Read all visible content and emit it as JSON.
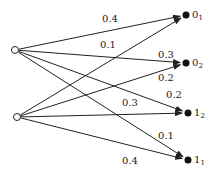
{
  "diagram": {
    "type": "bipartite-transition-graph",
    "sources": [
      {
        "id": "s0",
        "x": 15,
        "y": 50
      },
      {
        "id": "s1",
        "x": 17,
        "y": 117
      }
    ],
    "targets": [
      {
        "id": "t0",
        "label": "0",
        "sub": "1",
        "x": 186,
        "y": 15
      },
      {
        "id": "t1",
        "label": "0",
        "sub": "2",
        "x": 186,
        "y": 63
      },
      {
        "id": "t2",
        "label": "1",
        "sub": "2",
        "x": 188,
        "y": 113
      },
      {
        "id": "t3",
        "label": "1",
        "sub": "1",
        "x": 188,
        "y": 160
      }
    ],
    "edges": [
      {
        "from": "s0",
        "to": "t0",
        "weight": "0.4",
        "lx": 110,
        "ly": 22
      },
      {
        "from": "s0",
        "to": "t1",
        "weight": "0.3",
        "lx": 166,
        "ly": 58
      },
      {
        "from": "s0",
        "to": "t2",
        "weight": "0.2",
        "lx": 174,
        "ly": 98
      },
      {
        "from": "s0",
        "to": "t3",
        "weight": "0.1",
        "lx": 166,
        "ly": 139
      },
      {
        "from": "s1",
        "to": "t0",
        "weight": "0.1",
        "lx": 108,
        "ly": 48
      },
      {
        "from": "s1",
        "to": "t1",
        "weight": "0.2",
        "lx": 166,
        "ly": 81
      },
      {
        "from": "s1",
        "to": "t2",
        "weight": "0.3",
        "lx": 130,
        "ly": 106
      },
      {
        "from": "s1",
        "to": "t3",
        "weight": "0.4",
        "lx": 130,
        "ly": 164
      }
    ]
  }
}
